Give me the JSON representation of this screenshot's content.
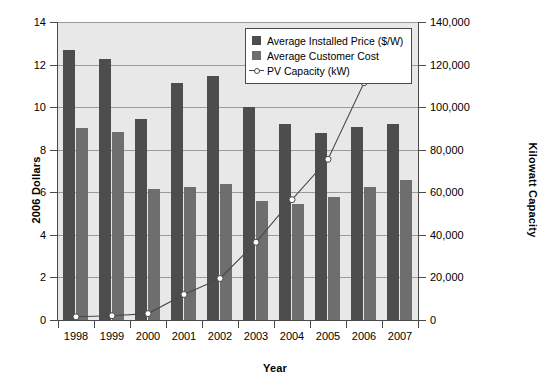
{
  "chart_data": {
    "type": "bar",
    "title": "",
    "xlabel": "Year",
    "ylabel": "2006 Dollars",
    "ylabel_secondary": "Kilowatt Capacity",
    "categories": [
      "1998",
      "1999",
      "2000",
      "2001",
      "2002",
      "2003",
      "2004",
      "2005",
      "2006",
      "2007"
    ],
    "ylim": [
      0,
      14
    ],
    "ylim_secondary": [
      0,
      140000
    ],
    "yticks": [
      "0",
      "2",
      "4",
      "6",
      "8",
      "10",
      "12",
      "14"
    ],
    "ytick_values": [
      0,
      2,
      4,
      6,
      8,
      10,
      12,
      14
    ],
    "yticks_secondary": [
      "0",
      "20,000",
      "40,000",
      "60,000",
      "80,000",
      "100,000",
      "120,000",
      "140,000"
    ],
    "ytick_values_secondary": [
      0,
      20000,
      40000,
      60000,
      80000,
      100000,
      120000,
      140000
    ],
    "grid": true,
    "legend_position": "top-right",
    "series": [
      {
        "name": "Average Installed Price ($/W)",
        "kind": "bar",
        "axis": "left",
        "color": "#4d4d4d",
        "values": [
          12.7,
          12.25,
          9.45,
          11.15,
          11.45,
          10.0,
          9.2,
          8.8,
          9.05,
          9.2
        ]
      },
      {
        "name": "Average Customer Cost",
        "kind": "bar",
        "axis": "left",
        "color": "#6e6e6e",
        "values": [
          9.0,
          8.85,
          6.15,
          6.25,
          6.4,
          5.6,
          5.45,
          5.8,
          6.25,
          6.6
        ]
      },
      {
        "name": "PV Capacity (kW)",
        "kind": "line",
        "axis": "right",
        "color": "#4a4a4a",
        "marker": "open-circle",
        "values": [
          1500,
          2000,
          3000,
          12000,
          19500,
          36500,
          56500,
          75500,
          111500,
          128500
        ]
      }
    ]
  },
  "legend": {
    "items": [
      {
        "label": "Average Installed Price ($/W)",
        "type": "swatch-dark"
      },
      {
        "label": "Average Customer Cost",
        "type": "swatch-medium"
      },
      {
        "label": "PV Capacity (kW)",
        "type": "line-marker"
      }
    ]
  },
  "colors": {
    "price_bar": "#4d4d4d",
    "cost_bar": "#6e6e6e",
    "line": "#4a4a4a",
    "plot_background": "#e8e8e8",
    "gridline": "#9a9a9a",
    "axis": "#4a4a4a"
  }
}
